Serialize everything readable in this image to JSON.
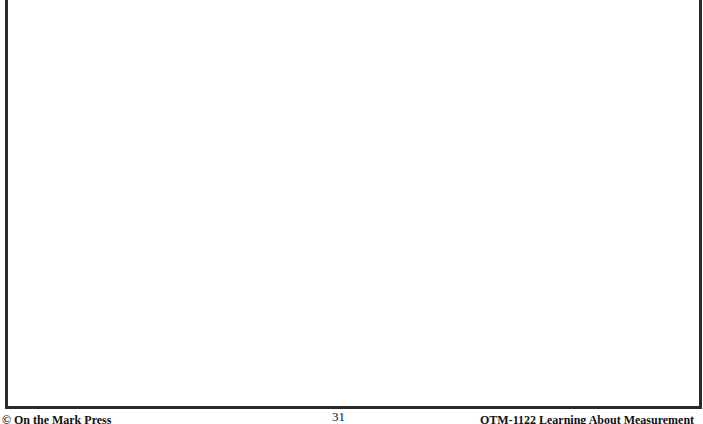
{
  "page": {
    "content_box": {
      "description": "empty bordered area"
    },
    "footer": {
      "copyright": "© On the Mark Press",
      "page_number": "31",
      "publication": "OTM-1122 Learning About Measurement"
    }
  }
}
